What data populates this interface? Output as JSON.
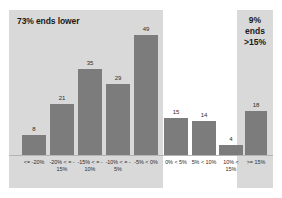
{
  "chart_data": {
    "type": "bar",
    "title": "",
    "subtitle": "",
    "xlabel": "",
    "ylabel": "",
    "ylim": [
      0,
      52
    ],
    "grid": false,
    "legend": "none",
    "categories": [
      "<= -20%",
      "-20% < = -15%",
      "-15% < = -10%",
      "-10% < = -5%",
      "-5% < 0%",
      "0% < 5%",
      "5% < 10%",
      "10% < 15%",
      ">= 15%"
    ],
    "category_lines": [
      [
        "<= -20%"
      ],
      [
        "-20% < = -",
        "15%"
      ],
      [
        "-15% < = -",
        "10%"
      ],
      [
        "-10% < = -",
        "5%"
      ],
      [
        "-5% < 0%"
      ],
      [
        "0% < 5%"
      ],
      [
        "5% < 10%"
      ],
      [
        "10% < ",
        "15%"
      ],
      [
        ">= 15%"
      ]
    ],
    "values": [
      8,
      21,
      35,
      29,
      49,
      15,
      14,
      4,
      18
    ],
    "value_labels": [
      "8",
      "21",
      "35",
      "29",
      "49",
      "15",
      "14",
      "4",
      "18"
    ],
    "bar_color": "#7c7c7c",
    "panel_color": "#d9d9d9",
    "background_color": "#ffffff",
    "annotations": [
      {
        "name": "ends-lower-annotation",
        "text": "73% ends lower",
        "covers_categories": [
          "<= -20%",
          "-20% < = -15%",
          "-15% < = -10%",
          "-10% < = -5%",
          "-5% < 0%"
        ]
      },
      {
        "name": "ends-above-15-annotation",
        "lines": [
          "9%",
          "ends",
          ">15%"
        ],
        "covers_categories": [
          ">= 15%"
        ]
      }
    ]
  }
}
